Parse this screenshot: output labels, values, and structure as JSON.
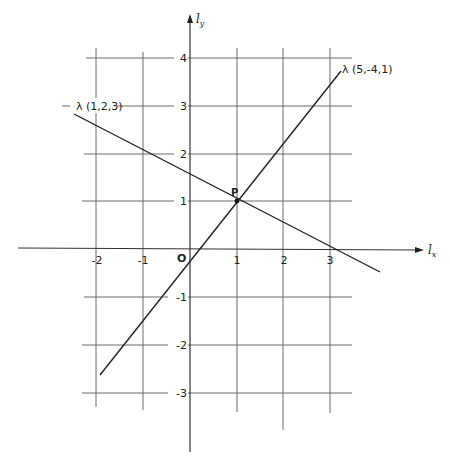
{
  "diagram": {
    "type": "coordinate-plane-lines",
    "axes": {
      "x_label": "l",
      "x_label_sub": "x",
      "y_label": "l",
      "y_label_sub": "y",
      "origin_label": "O"
    },
    "x_ticks": [
      "-2",
      "-1",
      "1",
      "2",
      "3"
    ],
    "y_ticks": [
      "4",
      "3",
      "2",
      "1",
      "-1",
      "-2",
      "-3"
    ],
    "lines": [
      {
        "label": "λ (1,2,3)",
        "equation": "x + 2y = 3"
      },
      {
        "label": "λ (5,-4,1)",
        "equation": "5x - 4y = 1"
      }
    ],
    "intersection": {
      "label": "P",
      "x": 1,
      "y": 1
    }
  }
}
